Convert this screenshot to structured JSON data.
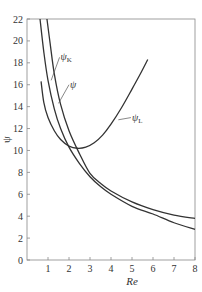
{
  "chart_data": {
    "type": "line",
    "title": "",
    "xlabel": "Re",
    "ylabel": "ψ",
    "xlim": [
      0,
      8
    ],
    "ylim": [
      0,
      22
    ],
    "xticks": [
      1,
      2,
      3,
      4,
      5,
      6,
      7,
      8
    ],
    "yticks": [
      0,
      2,
      4,
      6,
      8,
      10,
      12,
      14,
      16,
      18,
      20,
      22
    ],
    "grid": false,
    "legend": "none (curves labeled directly)",
    "series": [
      {
        "name": "ψ_K",
        "label_main": "ψ",
        "label_sub": "K",
        "x": [
          0.62,
          0.8,
          1.0,
          1.3,
          1.6,
          2.0,
          2.5,
          3.0,
          3.5,
          4.0,
          5.0,
          6.0,
          7.0,
          8.0
        ],
        "y": [
          22,
          19.0,
          16.4,
          13.8,
          12.0,
          10.3,
          8.8,
          7.6,
          6.7,
          6.0,
          4.9,
          4.2,
          3.4,
          2.8
        ]
      },
      {
        "name": "ψ",
        "label_main": "ψ",
        "label_sub": "",
        "x": [
          0.95,
          1.1,
          1.3,
          1.6,
          2.0,
          2.5,
          3.0,
          3.5,
          4.0,
          5.0,
          6.0,
          7.0,
          8.0
        ],
        "y": [
          22,
          19.8,
          17.0,
          14.2,
          11.8,
          9.7,
          7.9,
          7.0,
          6.3,
          5.3,
          4.6,
          4.1,
          3.8
        ]
      },
      {
        "name": "ψ_L",
        "label_main": "ψ",
        "label_sub": "L",
        "x": [
          0.67,
          0.8,
          1.0,
          1.3,
          1.6,
          2.0,
          2.4,
          2.8,
          3.2,
          3.6,
          4.0,
          4.5,
          5.0,
          5.4,
          5.75
        ],
        "y": [
          16.3,
          14.4,
          13.0,
          11.8,
          11.0,
          10.4,
          10.2,
          10.3,
          10.7,
          11.4,
          12.4,
          13.9,
          15.6,
          17.0,
          18.3
        ]
      }
    ],
    "annotations": [
      {
        "text": "ψK",
        "points_to": "ψ_K",
        "at": [
          1.2,
          16.5
        ]
      },
      {
        "text": "ψ",
        "points_to": "ψ",
        "at": [
          1.55,
          14.7
        ]
      },
      {
        "text": "ψL",
        "points_to": "ψ_L",
        "at": [
          4.9,
          11.9
        ]
      }
    ]
  }
}
